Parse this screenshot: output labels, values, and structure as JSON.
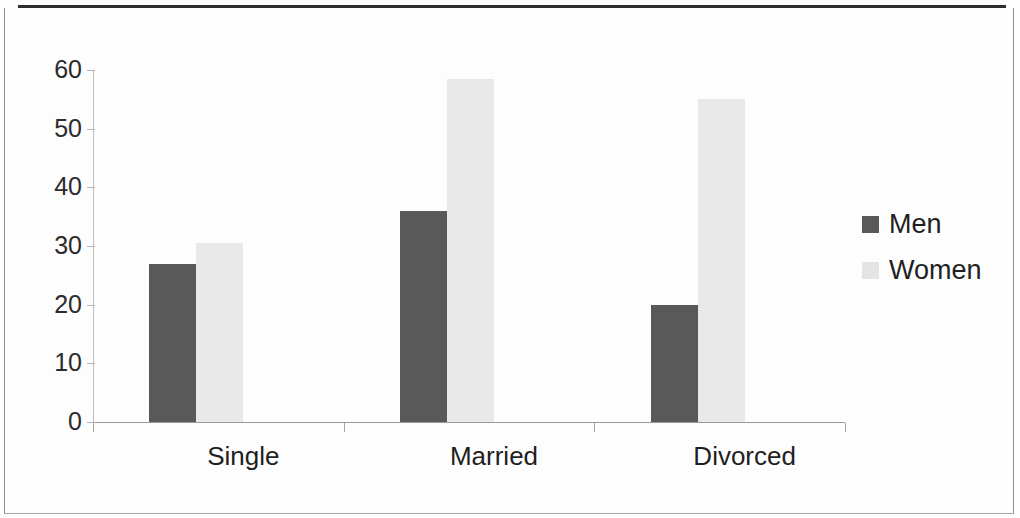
{
  "chart_data": {
    "type": "bar",
    "title": "",
    "subtitle": "",
    "xlabel": "",
    "ylabel": "",
    "categories": [
      "Single",
      "Married",
      "Divorced"
    ],
    "series": [
      {
        "name": "Men",
        "values": [
          27,
          36,
          20
        ],
        "color": "#595959"
      },
      {
        "name": "Women",
        "values": [
          30.5,
          58.5,
          55
        ],
        "color": "#e9e9e9"
      }
    ],
    "ylim": [
      0,
      60
    ],
    "yticks": [
      0,
      10,
      20,
      30,
      40,
      50,
      60
    ],
    "ytick_labels": [
      "0",
      "10",
      "20",
      "30",
      "40",
      "50",
      "60"
    ],
    "grid": false,
    "legend_position": "right",
    "orientation": "vertical",
    "grouped": true
  },
  "legend": {
    "entries": [
      {
        "label": "Men",
        "swatch": "men"
      },
      {
        "label": "Women",
        "swatch": "women"
      }
    ]
  },
  "axis": {
    "y_labels": [
      "60",
      "50",
      "40",
      "30",
      "20",
      "10",
      "0"
    ],
    "x_labels": [
      "Single",
      "Married",
      "Divorced"
    ]
  }
}
